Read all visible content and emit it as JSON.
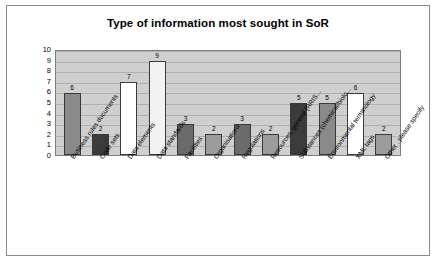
{
  "chart_data": {
    "type": "bar",
    "title": "Type of information most sought in SoR",
    "xlabel": "",
    "ylabel": "",
    "ylim": [
      0,
      10
    ],
    "yticks": [
      0,
      1,
      2,
      3,
      4,
      5,
      6,
      7,
      8,
      9,
      10
    ],
    "grid": true,
    "legend": "none",
    "categories": [
      "Business rules documents",
      "Code sets",
      "Data elements",
      "Data standards",
      "Facilities",
      "Organisations",
      "Regulations",
      "Resources, general (RRIS...",
      "Substances (chemical/biolo...",
      "Environmental terminology",
      "XML tags",
      "Other , please specify"
    ],
    "values": [
      6,
      2,
      7,
      9,
      3,
      2,
      3,
      2,
      5,
      5,
      6,
      2
    ],
    "bar_colors": [
      "#8a8a8a",
      "#3b3b3b",
      "#ffffff",
      "#f2f2f2",
      "#6b6b6b",
      "#9c9c9c",
      "#6b6b6b",
      "#9c9c9c",
      "#3b3b3b",
      "#8a8a8a",
      "#ffffff",
      "#9c9c9c"
    ],
    "bar_value_labels": [
      "6",
      "2",
      "7",
      "9",
      "3",
      "2",
      "3",
      "2",
      "5",
      "5",
      "6",
      "2"
    ]
  },
  "colors": {
    "plot_background": "#cfcfcf",
    "card_border": "#8a8a8a",
    "gridline": "#b0b0b0",
    "text": "#000000"
  }
}
